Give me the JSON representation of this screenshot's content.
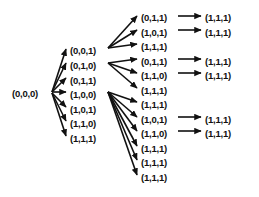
{
  "diagram": {
    "type": "directed-tree",
    "ink_color": "#111111",
    "background_color": "#ffffff",
    "columns": [
      {
        "index": 0,
        "name": "root-column",
        "x": 12,
        "nodes": [
          {
            "id": "n0",
            "label": "(0,0,0)",
            "y": 88
          }
        ]
      },
      {
        "index": 1,
        "name": "level-1-column",
        "x": 70,
        "nodes": [
          {
            "id": "n1",
            "label": "(0,0,1)",
            "y": 45
          },
          {
            "id": "n2",
            "label": "(0,1,0)",
            "y": 60
          },
          {
            "id": "n3",
            "label": "(0,1,1)",
            "y": 75
          },
          {
            "id": "n4",
            "label": "(1,0,0)",
            "y": 89
          },
          {
            "id": "n5",
            "label": "(1,0,1)",
            "y": 104
          },
          {
            "id": "n6",
            "label": "(1,1,0)",
            "y": 118
          },
          {
            "id": "n7",
            "label": "(1,1,1)",
            "y": 133
          }
        ]
      },
      {
        "index": 2,
        "name": "level-2-column",
        "x": 141,
        "nodes": [
          {
            "id": "m1",
            "label": "(0,1,1)",
            "y": 12
          },
          {
            "id": "m2",
            "label": "(1,0,1)",
            "y": 27
          },
          {
            "id": "m3",
            "label": "(1,1,1)",
            "y": 41
          },
          {
            "id": "m4",
            "label": "(0,1,1)",
            "y": 56
          },
          {
            "id": "m5",
            "label": "(1,1,0)",
            "y": 70
          },
          {
            "id": "m6",
            "label": "(1,1,1)",
            "y": 85
          },
          {
            "id": "m7",
            "label": "(1,1,1)",
            "y": 99
          },
          {
            "id": "m8",
            "label": "(1,0,1)",
            "y": 114
          },
          {
            "id": "m9",
            "label": "(1,1,0)",
            "y": 128
          },
          {
            "id": "m10",
            "label": "(1,1,1)",
            "y": 143
          },
          {
            "id": "m11",
            "label": "(1,1,1)",
            "y": 157
          },
          {
            "id": "m12",
            "label": "(1,1,1)",
            "y": 172
          }
        ]
      },
      {
        "index": 3,
        "name": "level-3-column",
        "x": 205,
        "nodes": [
          {
            "id": "t1",
            "label": "(1,1,1)",
            "y": 12
          },
          {
            "id": "t2",
            "label": "(1,1,1)",
            "y": 27
          },
          {
            "id": "t3",
            "label": "(1,1,1)",
            "y": 56
          },
          {
            "id": "t4",
            "label": "(1,1,1)",
            "y": 70
          },
          {
            "id": "t5",
            "label": "(1,1,1)",
            "y": 114
          },
          {
            "id": "t6",
            "label": "(1,1,1)",
            "y": 128
          }
        ]
      }
    ],
    "edges": [
      {
        "from": "n0",
        "to": "n1",
        "x1": 52,
        "y1": 92,
        "x2": 66,
        "y2": 49
      },
      {
        "from": "n0",
        "to": "n2",
        "x1": 52,
        "y1": 92,
        "x2": 66,
        "y2": 63
      },
      {
        "from": "n0",
        "to": "n3",
        "x1": 52,
        "y1": 92,
        "x2": 66,
        "y2": 78
      },
      {
        "from": "n0",
        "to": "n4",
        "x1": 52,
        "y1": 92,
        "x2": 66,
        "y2": 92
      },
      {
        "from": "n0",
        "to": "n5",
        "x1": 52,
        "y1": 93,
        "x2": 66,
        "y2": 107
      },
      {
        "from": "n0",
        "to": "n6",
        "x1": 52,
        "y1": 93,
        "x2": 66,
        "y2": 121
      },
      {
        "from": "n0",
        "to": "n7",
        "x1": 52,
        "y1": 93,
        "x2": 66,
        "y2": 136
      },
      {
        "from": "n1",
        "to": "m1",
        "x1": 108,
        "y1": 48,
        "x2": 137,
        "y2": 16
      },
      {
        "from": "n1",
        "to": "m2",
        "x1": 108,
        "y1": 48,
        "x2": 137,
        "y2": 30
      },
      {
        "from": "n1",
        "to": "m3",
        "x1": 108,
        "y1": 48,
        "x2": 137,
        "y2": 44
      },
      {
        "from": "n2",
        "to": "m4",
        "x1": 108,
        "y1": 63,
        "x2": 137,
        "y2": 59
      },
      {
        "from": "n2",
        "to": "m5",
        "x1": 108,
        "y1": 63,
        "x2": 137,
        "y2": 73
      },
      {
        "from": "n2",
        "to": "m6",
        "x1": 108,
        "y1": 63,
        "x2": 137,
        "y2": 88
      },
      {
        "from": "n4",
        "to": "m7",
        "x1": 108,
        "y1": 92,
        "x2": 137,
        "y2": 102
      },
      {
        "from": "n4",
        "to": "m8",
        "x1": 108,
        "y1": 92,
        "x2": 137,
        "y2": 117
      },
      {
        "from": "n4",
        "to": "m9",
        "x1": 108,
        "y1": 92,
        "x2": 137,
        "y2": 131
      },
      {
        "from": "n4",
        "to": "m10",
        "x1": 108,
        "y1": 92,
        "x2": 137,
        "y2": 146
      },
      {
        "from": "n4",
        "to": "m11",
        "x1": 108,
        "y1": 92,
        "x2": 137,
        "y2": 160
      },
      {
        "from": "n4",
        "to": "m12",
        "x1": 108,
        "y1": 92,
        "x2": 137,
        "y2": 175
      },
      {
        "from": "m1",
        "to": "t1",
        "x1": 178,
        "y1": 16,
        "x2": 201,
        "y2": 16
      },
      {
        "from": "m2",
        "to": "t2",
        "x1": 178,
        "y1": 30,
        "x2": 201,
        "y2": 30
      },
      {
        "from": "m4",
        "to": "t3",
        "x1": 178,
        "y1": 59,
        "x2": 201,
        "y2": 59
      },
      {
        "from": "m5",
        "to": "t4",
        "x1": 178,
        "y1": 73,
        "x2": 201,
        "y2": 73
      },
      {
        "from": "m8",
        "to": "t5",
        "x1": 178,
        "y1": 117,
        "x2": 201,
        "y2": 117
      },
      {
        "from": "m9",
        "to": "t6",
        "x1": 178,
        "y1": 131,
        "x2": 201,
        "y2": 131
      }
    ]
  }
}
